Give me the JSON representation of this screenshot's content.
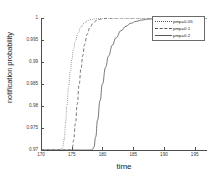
{
  "chart_data": {
    "type": "line",
    "title": "",
    "xlabel": "time",
    "ylabel": "notification probability",
    "xlim": [
      170,
      197
    ],
    "ylim": [
      0.97,
      1.0
    ],
    "xticks": [
      170,
      175,
      180,
      185,
      190,
      195
    ],
    "xtick_labels": [
      "170",
      "175",
      "180",
      "185",
      "190",
      "195"
    ],
    "yticks": [
      0.97,
      0.975,
      0.98,
      0.985,
      0.99,
      0.995,
      1
    ],
    "ytick_labels": [
      "0.97",
      "0.975",
      "0.98",
      "0.985",
      "0.99",
      "0.995",
      "1"
    ],
    "grid": false,
    "legend_position": "upper right",
    "series": [
      {
        "name": "pmp=0.05",
        "style": "dotted",
        "color": "#555555",
        "x": [
          170,
          173.0,
          173.5,
          173.8,
          174.0,
          174.2,
          174.5,
          174.8,
          175.0,
          175.3,
          175.6,
          176.0,
          176.5,
          177.0,
          177.5,
          178.0,
          179.0,
          180.0,
          182.0,
          185.0,
          190.0,
          197.0
        ],
        "y": [
          0.97,
          0.97,
          0.9705,
          0.9725,
          0.9762,
          0.98,
          0.9845,
          0.988,
          0.9905,
          0.993,
          0.9948,
          0.9965,
          0.998,
          0.9988,
          0.9993,
          0.9996,
          0.99985,
          0.99995,
          1.0,
          1.0,
          1.0,
          1.0
        ]
      },
      {
        "name": "pmp=0.1",
        "style": "dashed",
        "color": "#555555",
        "x": [
          170,
          174.8,
          175.1,
          175.3,
          175.6,
          175.9,
          176.2,
          176.5,
          176.8,
          177.1,
          177.5,
          178.0,
          178.5,
          179.0,
          179.5,
          180.0,
          181.0,
          182.5,
          185.0,
          190.0,
          197.0
        ],
        "y": [
          0.97,
          0.97,
          0.9705,
          0.9722,
          0.976,
          0.9805,
          0.9848,
          0.9885,
          0.9915,
          0.994,
          0.9963,
          0.998,
          0.9989,
          0.9994,
          0.99968,
          0.99982,
          0.99995,
          1.0,
          1.0,
          1.0,
          1.0
        ]
      },
      {
        "name": "pmp=0.2",
        "style": "solid",
        "color": "#555555",
        "x": [
          170,
          178.3,
          178.6,
          178.9,
          179.2,
          179.6,
          180.0,
          180.5,
          181.0,
          181.6,
          182.2,
          183.0,
          183.8,
          184.6,
          185.5,
          186.4,
          187.5,
          188.6,
          190.0,
          192.0,
          194.5,
          197.0
        ],
        "y": [
          0.97,
          0.97,
          0.9706,
          0.973,
          0.9768,
          0.9812,
          0.985,
          0.9888,
          0.9914,
          0.9938,
          0.9955,
          0.9971,
          0.9981,
          0.9988,
          0.99925,
          0.99954,
          0.99974,
          0.99986,
          0.99994,
          0.99999,
          1.0,
          1.0
        ]
      }
    ]
  },
  "legend": {
    "entries": [
      {
        "label": "pmp=0.05"
      },
      {
        "label": "pmp=0.1"
      },
      {
        "label": "pmp=0.2"
      }
    ]
  }
}
